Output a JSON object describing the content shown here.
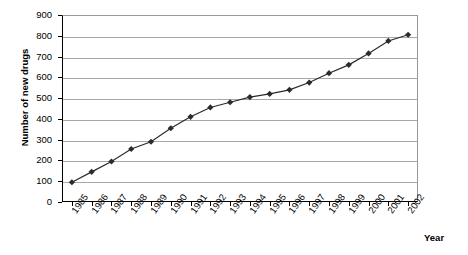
{
  "chart_data": {
    "type": "line",
    "title": "",
    "xlabel": "Year",
    "ylabel": "Number of new drugs",
    "categories": [
      "1985",
      "1986",
      "1987",
      "1988",
      "1989",
      "1990",
      "1991",
      "1992",
      "1993",
      "1994",
      "1995",
      "1996",
      "1997",
      "1998",
      "1999",
      "2000",
      "2001",
      "2002"
    ],
    "values": [
      95,
      145,
      195,
      255,
      290,
      355,
      410,
      455,
      480,
      505,
      520,
      540,
      575,
      620,
      660,
      715,
      775,
      805
    ],
    "series": [
      {
        "name": "Number of new drugs",
        "values": [
          95,
          145,
          195,
          255,
          290,
          355,
          410,
          455,
          480,
          505,
          520,
          540,
          575,
          620,
          660,
          715,
          775,
          805
        ]
      }
    ],
    "ylim": [
      0,
      900
    ],
    "yticks": [
      0,
      100,
      200,
      300,
      400,
      500,
      600,
      700,
      800,
      900
    ],
    "ytick_labels": [
      "0",
      "100",
      "200",
      "300",
      "400",
      "500",
      "600",
      "700",
      "800",
      "900"
    ],
    "grid": true,
    "legend": "none",
    "marker": "diamond",
    "line_color": "#2b2b2b",
    "grid_color": "#a8a8a8"
  }
}
